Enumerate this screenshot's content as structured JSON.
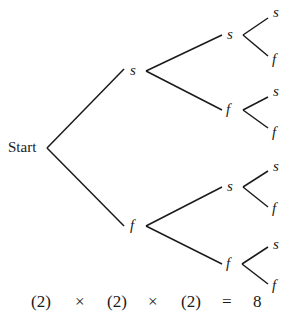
{
  "diagram": {
    "type": "tree",
    "root_label": "Start",
    "level1": [
      {
        "label": "s",
        "children": [
          {
            "label": "s",
            "children": [
              {
                "label": "s"
              },
              {
                "label": "f"
              }
            ]
          },
          {
            "label": "f",
            "children": [
              {
                "label": "s"
              },
              {
                "label": "f"
              }
            ]
          }
        ]
      },
      {
        "label": "f",
        "children": [
          {
            "label": "s",
            "children": [
              {
                "label": "s"
              },
              {
                "label": "f"
              }
            ]
          },
          {
            "label": "f",
            "children": [
              {
                "label": "s"
              },
              {
                "label": "f"
              }
            ]
          }
        ]
      }
    ],
    "equation": {
      "factors": [
        "(2)",
        "(2)",
        "(2)"
      ],
      "times": "×",
      "equals": "=",
      "result": "8"
    }
  }
}
